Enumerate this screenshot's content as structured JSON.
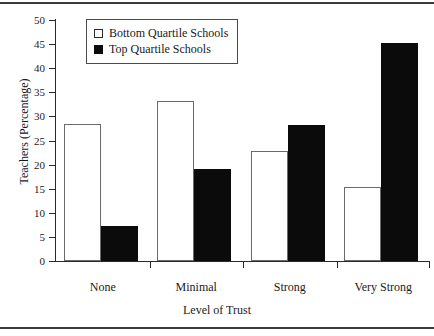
{
  "chart_data": {
    "type": "bar",
    "title": "",
    "xlabel": "Level of Trust",
    "ylabel": "Teachers (Percentage)",
    "categories": [
      "None",
      "Minimal",
      "Strong",
      "Very Strong"
    ],
    "series": [
      {
        "name": "Bottom Quartile Schools",
        "color": "#ffffff",
        "values": [
          28.4,
          33.2,
          22.9,
          15.3
        ]
      },
      {
        "name": "Top Quartile Schools",
        "color": "#0b0b0b",
        "values": [
          7.2,
          19.1,
          28.2,
          45.2
        ]
      }
    ],
    "ylim": [
      0,
      50
    ],
    "ytick_labels": [
      "0",
      "5",
      "10",
      "15",
      "20",
      "25",
      "30",
      "35",
      "40",
      "45",
      "50"
    ],
    "ytick_values": [
      0,
      5,
      10,
      15,
      20,
      25,
      30,
      35,
      40,
      45,
      50
    ],
    "grid": false,
    "legend_position": "top-left-inside"
  },
  "legend": {
    "entries": [
      {
        "label": "Bottom Quartile Schools",
        "swatch": "open-square"
      },
      {
        "label": "Top Quartile Schools",
        "swatch": "filled-square"
      }
    ]
  }
}
